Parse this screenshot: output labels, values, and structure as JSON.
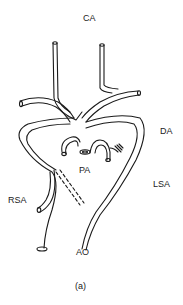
{
  "figure": {
    "caption": "(a)",
    "labels": {
      "ca": "CA",
      "da": "DA",
      "pa": "PA",
      "lsa": "LSA",
      "rsa": "RSA",
      "ao": "AO"
    },
    "line_color": "#1a1a1a",
    "background": "#ffffff"
  }
}
